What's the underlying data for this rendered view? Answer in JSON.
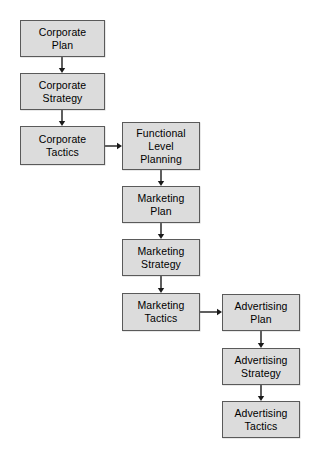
{
  "diagram": {
    "style": {
      "node_fill": "#dcdcdc",
      "node_border": "#5a5a5a",
      "text_color": "#000000",
      "arrow_color": "#1a1a1a",
      "background": "#ffffff"
    },
    "nodes": [
      {
        "id": "corporate-plan",
        "label": "Corporate\nPlan",
        "column": 1,
        "x": 20,
        "y": 20,
        "width": 85,
        "height": 37
      },
      {
        "id": "corporate-strategy",
        "label": "Corporate\nStrategy",
        "column": 1,
        "x": 20,
        "y": 73,
        "width": 85,
        "height": 37
      },
      {
        "id": "corporate-tactics",
        "label": "Corporate\nTactics",
        "column": 1,
        "x": 20,
        "y": 126,
        "width": 85,
        "height": 39
      },
      {
        "id": "functional-level-planning",
        "label": "Functional\nLevel\nPlanning",
        "column": 2,
        "x": 122,
        "y": 122,
        "width": 78,
        "height": 48
      },
      {
        "id": "marketing-plan",
        "label": "Marketing\nPlan",
        "column": 2,
        "x": 122,
        "y": 186,
        "width": 78,
        "height": 37
      },
      {
        "id": "marketing-strategy",
        "label": "Marketing\nStrategy",
        "column": 2,
        "x": 122,
        "y": 239,
        "width": 78,
        "height": 37
      },
      {
        "id": "marketing-tactics",
        "label": "Marketing\nTactics",
        "column": 2,
        "x": 122,
        "y": 293,
        "width": 78,
        "height": 38
      },
      {
        "id": "advertising-plan",
        "label": "Advertising\nPlan",
        "column": 3,
        "x": 222,
        "y": 294,
        "width": 78,
        "height": 37
      },
      {
        "id": "advertising-strategy",
        "label": "Advertising\nStrategy",
        "column": 3,
        "x": 222,
        "y": 348,
        "width": 78,
        "height": 37
      },
      {
        "id": "advertising-tactics",
        "label": "Advertising\nTactics",
        "column": 3,
        "x": 222,
        "y": 401,
        "width": 78,
        "height": 37
      }
    ],
    "edges": [
      {
        "id": "corporate-plan-to-corporate-strategy",
        "from": "corporate-plan",
        "to": "corporate-strategy",
        "orientation": "vertical",
        "x": 62,
        "y1": 57,
        "y2": 73
      },
      {
        "id": "corporate-strategy-to-corporate-tactics",
        "from": "corporate-strategy",
        "to": "corporate-tactics",
        "orientation": "vertical",
        "x": 62,
        "y1": 110,
        "y2": 126
      },
      {
        "id": "corporate-tactics-to-functional-level-planning",
        "from": "corporate-tactics",
        "to": "functional-level-planning",
        "orientation": "horizontal",
        "y": 146,
        "x1": 105,
        "x2": 122
      },
      {
        "id": "functional-level-planning-to-marketing-plan",
        "from": "functional-level-planning",
        "to": "marketing-plan",
        "orientation": "vertical",
        "x": 161,
        "y1": 170,
        "y2": 186
      },
      {
        "id": "marketing-plan-to-marketing-strategy",
        "from": "marketing-plan",
        "to": "marketing-strategy",
        "orientation": "vertical",
        "x": 161,
        "y1": 223,
        "y2": 239
      },
      {
        "id": "marketing-strategy-to-marketing-tactics",
        "from": "marketing-strategy",
        "to": "marketing-tactics",
        "orientation": "vertical",
        "x": 161,
        "y1": 276,
        "y2": 293
      },
      {
        "id": "marketing-tactics-to-advertising-plan",
        "from": "marketing-tactics",
        "to": "advertising-plan",
        "orientation": "horizontal",
        "y": 312,
        "x1": 200,
        "x2": 222
      },
      {
        "id": "advertising-plan-to-advertising-strategy",
        "from": "advertising-plan",
        "to": "advertising-strategy",
        "orientation": "vertical",
        "x": 261,
        "y1": 331,
        "y2": 348
      },
      {
        "id": "advertising-strategy-to-advertising-tactics",
        "from": "advertising-strategy",
        "to": "advertising-tactics",
        "orientation": "vertical",
        "x": 261,
        "y1": 385,
        "y2": 401
      }
    ]
  }
}
